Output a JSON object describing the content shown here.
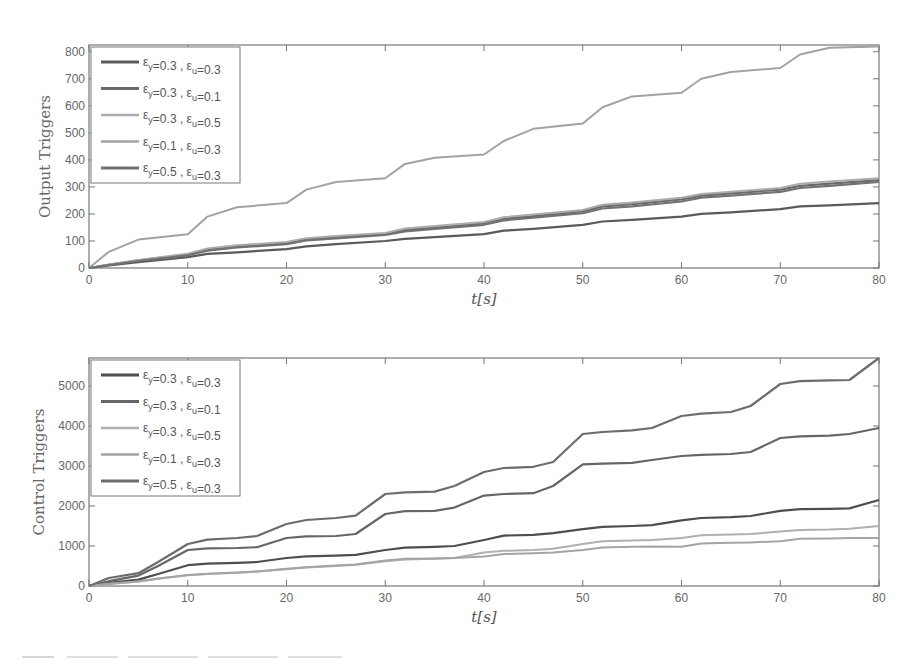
{
  "chart_data": [
    {
      "type": "line",
      "title": "",
      "xlabel": "t[s]",
      "ylabel": "Output Triggers",
      "xlim": [
        0,
        80
      ],
      "ylim": [
        0,
        825
      ],
      "xticks": [
        0,
        10,
        20,
        30,
        40,
        50,
        60,
        70,
        80
      ],
      "yticks": [
        0,
        100,
        200,
        300,
        400,
        500,
        600,
        700,
        800
      ],
      "grid": false,
      "legend_position": "upper left",
      "x": [
        0,
        2,
        5,
        10,
        12,
        15,
        20,
        22,
        25,
        30,
        32,
        35,
        40,
        42,
        45,
        50,
        52,
        55,
        60,
        62,
        65,
        70,
        72,
        75,
        80
      ],
      "series": [
        {
          "name": "εy=0.3 , εu=0.3",
          "color": "#5a5a5a",
          "width": 2.2,
          "values": [
            0,
            10,
            22,
            40,
            52,
            58,
            70,
            80,
            88,
            100,
            108,
            114,
            125,
            138,
            145,
            160,
            172,
            178,
            190,
            200,
            206,
            218,
            228,
            232,
            240
          ]
        },
        {
          "name": "εy=0.3 , εu=0.1",
          "color": "#6a6a6a",
          "width": 2.2,
          "values": [
            0,
            12,
            28,
            50,
            68,
            80,
            92,
            106,
            114,
            126,
            140,
            150,
            165,
            182,
            192,
            210,
            228,
            236,
            254,
            268,
            276,
            290,
            304,
            312,
            325
          ]
        },
        {
          "name": "εy=0.3 , εu=0.5",
          "color": "#ababab",
          "width": 2,
          "values": [
            0,
            13,
            30,
            53,
            72,
            84,
            96,
            110,
            118,
            130,
            146,
            155,
            170,
            188,
            198,
            215,
            234,
            242,
            260,
            274,
            282,
            296,
            312,
            320,
            332
          ]
        },
        {
          "name": "εy=0.1 , εu=0.3",
          "color": "#a2a2a2",
          "width": 2,
          "values": [
            0,
            60,
            105,
            125,
            190,
            225,
            240,
            290,
            318,
            332,
            385,
            408,
            420,
            470,
            515,
            535,
            595,
            635,
            648,
            700,
            725,
            740,
            790,
            815,
            820
          ]
        },
        {
          "name": "εy=0.5 , εu=0.3",
          "color": "#727272",
          "width": 2.2,
          "values": [
            0,
            11,
            26,
            47,
            64,
            76,
            88,
            102,
            110,
            122,
            135,
            145,
            160,
            176,
            186,
            203,
            220,
            228,
            246,
            260,
            268,
            282,
            296,
            304,
            318
          ]
        }
      ]
    },
    {
      "type": "line",
      "title": "",
      "xlabel": "t[s]",
      "ylabel": "Control Triggers",
      "xlim": [
        0,
        80
      ],
      "ylim": [
        0,
        5700
      ],
      "xticks": [
        0,
        10,
        20,
        30,
        40,
        50,
        60,
        70,
        80
      ],
      "yticks": [
        0,
        1000,
        2000,
        3000,
        4000,
        5000
      ],
      "grid": false,
      "legend_position": "upper left",
      "x": [
        0,
        2,
        5,
        7,
        10,
        12,
        15,
        17,
        20,
        22,
        25,
        27,
        30,
        32,
        35,
        37,
        40,
        42,
        45,
        47,
        50,
        52,
        55,
        57,
        60,
        62,
        65,
        67,
        70,
        72,
        75,
        77,
        80
      ],
      "series": [
        {
          "name": "εy=0.3 , εu=0.3",
          "color": "#4e4e4e",
          "width": 2.2,
          "values": [
            0,
            80,
            160,
            300,
            520,
            560,
            580,
            600,
            700,
            740,
            760,
            780,
            900,
            960,
            980,
            1000,
            1150,
            1260,
            1280,
            1320,
            1420,
            1480,
            1500,
            1520,
            1640,
            1700,
            1720,
            1750,
            1880,
            1920,
            1930,
            1940,
            2150
          ]
        },
        {
          "name": "εy=0.3 , εu=0.1",
          "color": "#666666",
          "width": 2.2,
          "values": [
            0,
            120,
            260,
            500,
            900,
            940,
            950,
            970,
            1200,
            1240,
            1250,
            1300,
            1800,
            1870,
            1880,
            1960,
            2260,
            2300,
            2320,
            2500,
            3040,
            3060,
            3080,
            3150,
            3250,
            3280,
            3300,
            3350,
            3700,
            3740,
            3760,
            3800,
            3950
          ]
        },
        {
          "name": "εy=0.3 , εu=0.5",
          "color": "#b0b0b0",
          "width": 2,
          "values": [
            0,
            50,
            110,
            180,
            270,
            300,
            330,
            360,
            420,
            460,
            500,
            530,
            620,
            660,
            680,
            700,
            840,
            880,
            900,
            930,
            1050,
            1120,
            1140,
            1150,
            1200,
            1270,
            1290,
            1300,
            1360,
            1400,
            1410,
            1430,
            1500
          ]
        },
        {
          "name": "εy=0.1 , εu=0.3",
          "color": "#a4a4a4",
          "width": 2,
          "values": [
            0,
            55,
            115,
            185,
            275,
            305,
            335,
            365,
            430,
            470,
            510,
            540,
            640,
            680,
            690,
            700,
            740,
            800,
            820,
            840,
            900,
            960,
            980,
            990,
            980,
            1060,
            1080,
            1090,
            1120,
            1180,
            1190,
            1200,
            1200
          ]
        },
        {
          "name": "εy=0.5 , εu=0.3",
          "color": "#6c6c6c",
          "width": 2.2,
          "values": [
            0,
            200,
            320,
            600,
            1050,
            1160,
            1200,
            1250,
            1550,
            1650,
            1700,
            1760,
            2300,
            2340,
            2360,
            2500,
            2850,
            2950,
            2980,
            3100,
            3800,
            3850,
            3890,
            3950,
            4250,
            4310,
            4350,
            4500,
            5050,
            5120,
            5140,
            5150,
            5700
          ]
        }
      ]
    }
  ],
  "legend_labels": [
    {
      "ey": "0.3",
      "eu": "0.3"
    },
    {
      "ey": "0.3",
      "eu": "0.1"
    },
    {
      "ey": "0.3",
      "eu": "0.5"
    },
    {
      "ey": "0.1",
      "eu": "0.3"
    },
    {
      "ey": "0.5",
      "eu": "0.3"
    }
  ],
  "symbols": {
    "epsilon": "ε",
    "sub_y": "y",
    "sub_u": "u"
  }
}
